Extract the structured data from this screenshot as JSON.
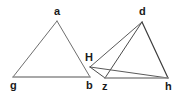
{
  "figure": {
    "type": "geometry-diagram",
    "width": 183,
    "height": 97,
    "background_color": "#ffffff",
    "colors": {
      "stroke_dark": "#3d3d3d",
      "stroke_mid": "#6e6e6e",
      "stroke_light": "#8c8c8c",
      "label_color": "#1a1a1a"
    },
    "vertices": [
      {
        "id": "a",
        "label": "a",
        "x": 57,
        "y": 21,
        "label_x": 54,
        "label_y": 6
      },
      {
        "id": "g",
        "label": "g",
        "x": 13,
        "y": 77,
        "label_x": 10,
        "label_y": 80
      },
      {
        "id": "b",
        "label": "b",
        "x": 90,
        "y": 77,
        "label_x": 86,
        "label_y": 80
      },
      {
        "id": "H",
        "label": "H",
        "x": 90,
        "y": 67,
        "label_x": 85,
        "label_y": 52
      },
      {
        "id": "d",
        "label": "d",
        "x": 142,
        "y": 22,
        "label_x": 139,
        "label_y": 6
      },
      {
        "id": "z",
        "label": "z",
        "x": 105,
        "y": 78,
        "label_x": 102,
        "label_y": 81
      },
      {
        "id": "h",
        "label": "h",
        "x": 168,
        "y": 78,
        "label_x": 165,
        "label_y": 81
      }
    ],
    "edges": [
      {
        "id": "a-g",
        "from": "a",
        "to": "g",
        "color": "#6e6e6e",
        "width": 1
      },
      {
        "id": "a-b",
        "from": "a",
        "to": "b",
        "color": "#6e6e6e",
        "width": 1
      },
      {
        "id": "g-b",
        "from": "g",
        "to": "b",
        "color": "#8c8c8c",
        "width": 1.4
      },
      {
        "id": "d-H",
        "from": "d",
        "to": "H",
        "color": "#5a5a5a",
        "width": 1
      },
      {
        "id": "d-z",
        "from": "d",
        "to": "z",
        "color": "#4a4a4a",
        "width": 1
      },
      {
        "id": "d-h",
        "from": "d",
        "to": "h",
        "color": "#3d3d3d",
        "width": 1.2
      },
      {
        "id": "H-h",
        "from": "H",
        "to": "h",
        "color": "#5a5a5a",
        "width": 1
      },
      {
        "id": "H-z",
        "from": "H",
        "to": "z",
        "color": "#4a4a4a",
        "width": 1
      },
      {
        "id": "z-h",
        "from": "z",
        "to": "h",
        "color": "#8c8c8c",
        "width": 1.4
      }
    ]
  }
}
